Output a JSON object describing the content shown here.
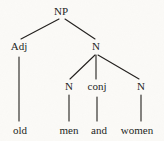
{
  "figure": {
    "type": "syntax-tree-diagram",
    "background_color": "#fbfaf7",
    "ink_color": "#221f1d",
    "width": 164,
    "height": 141
  },
  "nodes": [
    {
      "id": "np",
      "label": "NP",
      "x": 61,
      "y": 6,
      "level": 0,
      "kind": "nonterminal"
    },
    {
      "id": "adj",
      "label": "Adj",
      "x": 19,
      "y": 41,
      "level": 1,
      "kind": "nonterminal"
    },
    {
      "id": "n_top",
      "label": "N",
      "x": 96,
      "y": 41,
      "level": 1,
      "kind": "nonterminal"
    },
    {
      "id": "n_left",
      "label": "N",
      "x": 69,
      "y": 81,
      "level": 2,
      "kind": "nonterminal"
    },
    {
      "id": "conj",
      "label": "conj",
      "x": 97,
      "y": 81,
      "level": 2,
      "kind": "nonterminal"
    },
    {
      "id": "n_right",
      "label": "N",
      "x": 141,
      "y": 81,
      "level": 2,
      "kind": "nonterminal"
    }
  ],
  "terminals": [
    {
      "id": "old",
      "label": "old",
      "x": 20,
      "y": 125,
      "parent": "adj"
    },
    {
      "id": "men",
      "label": "men",
      "x": 69,
      "y": 125,
      "parent": "n_left"
    },
    {
      "id": "and",
      "label": "and",
      "x": 99,
      "y": 125,
      "parent": "conj"
    },
    {
      "id": "women",
      "label": "women",
      "x": 137,
      "y": 125,
      "parent": "n_right"
    }
  ],
  "edges": [
    {
      "from": "np",
      "to": "adj",
      "x1": 59,
      "y1": 19,
      "x2": 21,
      "y2": 39
    },
    {
      "from": "np",
      "to": "n_top",
      "x1": 65,
      "y1": 19,
      "x2": 95,
      "y2": 39
    },
    {
      "from": "n_top",
      "to": "n_left",
      "x1": 95,
      "y1": 55,
      "x2": 70,
      "y2": 79
    },
    {
      "from": "n_top",
      "to": "conj",
      "x1": 96,
      "y1": 55,
      "x2": 96,
      "y2": 79
    },
    {
      "from": "n_top",
      "to": "n_right",
      "x1": 98,
      "y1": 55,
      "x2": 139,
      "y2": 79
    },
    {
      "from": "adj",
      "to": "old",
      "x1": 19,
      "y1": 57,
      "x2": 19,
      "y2": 121
    },
    {
      "from": "n_left",
      "to": "men",
      "x1": 69,
      "y1": 95,
      "x2": 69,
      "y2": 121
    },
    {
      "from": "conj",
      "to": "and",
      "x1": 97,
      "y1": 97,
      "x2": 97,
      "y2": 121
    },
    {
      "from": "n_right",
      "to": "women",
      "x1": 141,
      "y1": 95,
      "x2": 141,
      "y2": 121
    }
  ],
  "chart_data": {
    "type": "tree",
    "title": "",
    "root": "NP",
    "sentence": "old men and women",
    "structure": "[NP [Adj old] [N [N men] [conj and] [N women]]]",
    "labels": [
      "NP",
      "Adj",
      "N",
      "N",
      "conj",
      "N",
      "old",
      "men",
      "and",
      "women"
    ]
  }
}
